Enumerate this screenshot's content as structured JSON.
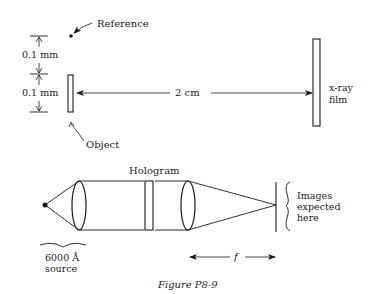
{
  "figure": {
    "caption": "Figure P8-9",
    "colors": {
      "ink": "#1a1a1a",
      "background": "#ffffff"
    }
  },
  "top_setup": {
    "reference_label": "Reference",
    "object_label": "Object",
    "dimension_top": "0.1 mm",
    "dimension_bottom": "0.1 mm",
    "distance_label": "2 cm",
    "film_label_line1": "x-ray",
    "film_label_line2": "film"
  },
  "bottom_setup": {
    "hologram_label": "Hologram",
    "source_label_line1": "6000 Å",
    "source_label_line2": "source",
    "images_label_line1": "Images",
    "images_label_line2": "expected",
    "images_label_line3": "here",
    "focal_label": "f"
  }
}
